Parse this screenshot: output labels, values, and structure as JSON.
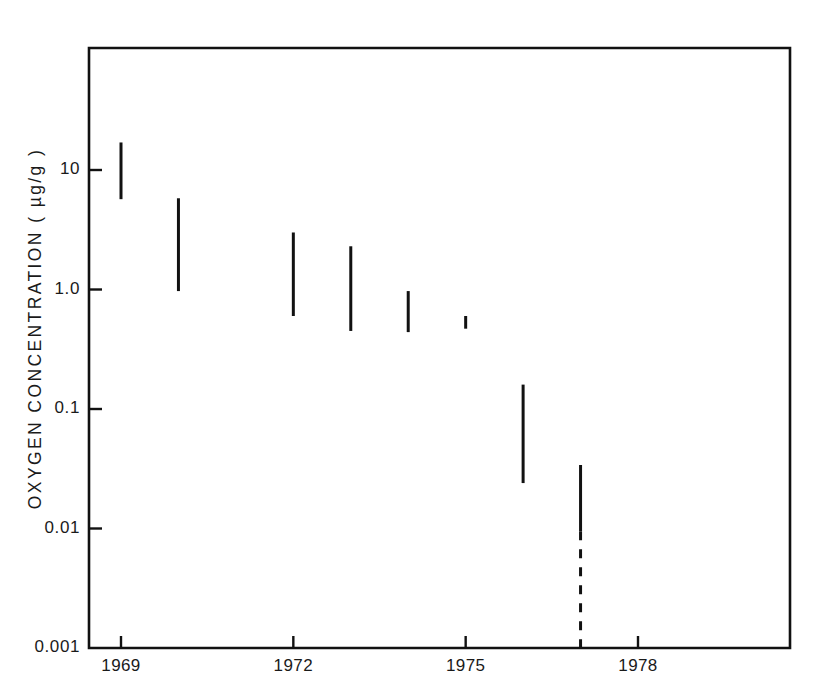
{
  "chart_data": {
    "type": "bar",
    "title": "",
    "subtitle": "",
    "xlabel": "",
    "ylabel": "OXYGEN  CONCENTRATION  ( µg/g )",
    "yscale": "log",
    "ylim": [
      0.001,
      40
    ],
    "xlim": [
      1968.2,
      1979.6
    ],
    "grid": false,
    "legend": null,
    "y_tick_labels": [
      "10",
      "1.0",
      "0.1",
      "0.01",
      "0.001"
    ],
    "y_tick_values": [
      10,
      1.0,
      0.1,
      0.01,
      0.001
    ],
    "x_tick_labels": [
      "1969",
      "1972",
      "1975",
      "1978"
    ],
    "x_tick_values": [
      1969,
      1972,
      1975,
      1978
    ],
    "note": "Vertical bars denote the measured range (minimum to maximum) of oxygen concentration for each year; the final 1977 bar continues as a dashed line down to the axis indicating an open / below-detection lower bound.",
    "series": [
      {
        "name": "Oxygen concentration range",
        "units": "µg/g",
        "points": [
          {
            "year": 1969,
            "high": 17.0,
            "low": 5.7,
            "style": "solid"
          },
          {
            "year": 1970,
            "high": 5.8,
            "low": 0.97,
            "style": "solid"
          },
          {
            "year": 1972,
            "high": 3.0,
            "low": 0.6,
            "style": "solid"
          },
          {
            "year": 1973,
            "high": 2.3,
            "low": 0.45,
            "style": "solid"
          },
          {
            "year": 1974,
            "high": 0.97,
            "low": 0.44,
            "style": "solid"
          },
          {
            "year": 1975,
            "high": 0.6,
            "low": 0.47,
            "style": "solid"
          },
          {
            "year": 1976,
            "high": 0.16,
            "low": 0.024,
            "style": "solid"
          },
          {
            "year": 1977,
            "high": 0.034,
            "low": 0.0095,
            "style": "solid",
            "dashed_low": 0.001
          }
        ]
      }
    ]
  },
  "axes": {
    "y_title": "OXYGEN  CONCENTRATION  ( µg/g )",
    "y_ticks": [
      {
        "label": "10",
        "value": 10
      },
      {
        "label": "1.0",
        "value": 1.0
      },
      {
        "label": "0.1",
        "value": 0.1
      },
      {
        "label": "0.01",
        "value": 0.01
      },
      {
        "label": "0.001",
        "value": 0.001
      }
    ],
    "x_ticks": [
      {
        "label": "1969",
        "value": 1969
      },
      {
        "label": "1972",
        "value": 1972
      },
      {
        "label": "1975",
        "value": 1975
      },
      {
        "label": "1978",
        "value": 1978
      }
    ]
  },
  "style": {
    "ink": "#111111",
    "background": "#ffffff"
  }
}
